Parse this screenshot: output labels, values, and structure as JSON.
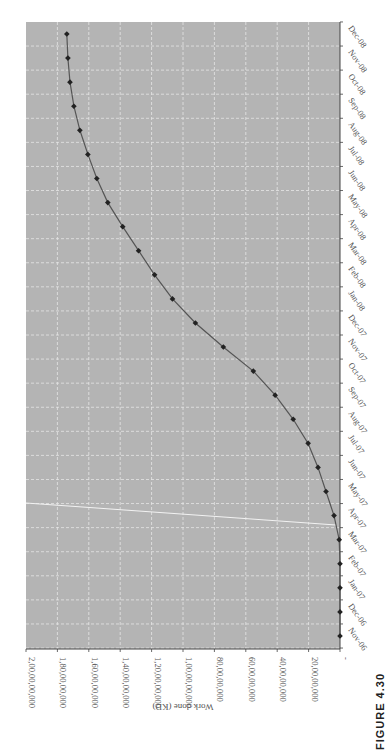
{
  "figure_label": "FIGURE 4.30",
  "chart_data": {
    "type": "line",
    "title": "",
    "xlabel": "",
    "ylabel": "Work done (KD)",
    "orientation": "rotated 90° clockwise on page",
    "categories": [
      "Nov-06",
      "Dec-06",
      "Jan-07",
      "Feb-07",
      "Mar-07",
      "Apr-07",
      "May-07",
      "Jun-07",
      "Jul-07",
      "Aug-07",
      "Sep-07",
      "Oct-07",
      "Nov-07",
      "Dec-07",
      "Jan-08",
      "Feb-08",
      "Mar-08",
      "Apr-08",
      "May-08",
      "Jun-08",
      "Jul-08",
      "Aug-08",
      "Sep-08",
      "Oct-08",
      "Nov-08",
      "Dec-08"
    ],
    "series": [
      {
        "name": "Cumulative work done",
        "values": [
          0,
          0,
          0,
          0,
          5000000,
          38000000,
          89000000,
          140000000,
          203000000,
          298000000,
          413000000,
          552000000,
          743000000,
          921000000,
          1067000000,
          1181000000,
          1283000000,
          1384000000,
          1479000000,
          1549000000,
          1606000000,
          1657000000,
          1695000000,
          1720000000,
          1733000000,
          1740000000
        ]
      }
    ],
    "yticks": [
      0,
      200000000,
      400000000,
      600000000,
      800000000,
      1000000000,
      1200000000,
      1400000000,
      1600000000,
      1800000000,
      2000000000
    ],
    "ytick_labels": [
      "-",
      "20,00,00,000",
      "40,00,00,000",
      "60,00,00,000",
      "80,00,00,000",
      "1,00,00,00,000",
      "1,20,00,00,000",
      "1,40,00,00,000",
      "1,60,00,00,000",
      "1,80,00,00,000",
      "2,00,00,00,000"
    ],
    "ylim": [
      0,
      2000000000
    ],
    "grid": true,
    "legend": null,
    "colors": {
      "plot_bg": "#b4b4b4",
      "grid": "#e6e6e6",
      "line": "#555555",
      "marker": "#222222",
      "annotation_line": "#f2f2f2"
    },
    "annotations": [
      {
        "type": "line",
        "description": "white reference line crossing near Apr-07"
      }
    ]
  }
}
